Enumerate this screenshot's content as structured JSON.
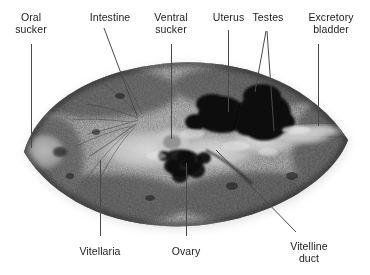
{
  "figure": {
    "image_type": "grayscale photomicrograph",
    "background_color": "#ffffff",
    "line_color": "#4a4a4a",
    "text_color": "#1b1b1b"
  },
  "labels": [
    {
      "id": "oral-sucker",
      "text": "Oral\nsucker",
      "x": 31,
      "y": 12,
      "align": "center",
      "position": "top-left"
    },
    {
      "id": "intestine",
      "text": "Intestine",
      "x": 110,
      "y": 12,
      "align": "center",
      "position": "top"
    },
    {
      "id": "ventral-sucker",
      "text": "Ventral\nsucker",
      "x": 171,
      "y": 12,
      "align": "center",
      "position": "top"
    },
    {
      "id": "uterus",
      "text": "Uterus",
      "x": 228,
      "y": 12,
      "align": "center",
      "position": "top"
    },
    {
      "id": "testes",
      "text": "Testes",
      "x": 268,
      "y": 12,
      "align": "center",
      "position": "top"
    },
    {
      "id": "excretory-bladder",
      "text": "Excretory\nbladder",
      "x": 331,
      "y": 12,
      "align": "center",
      "position": "top-right"
    },
    {
      "id": "vitellaria",
      "text": "Vitellaria",
      "x": 100,
      "y": 246,
      "align": "center",
      "position": "bottom-left"
    },
    {
      "id": "ovary",
      "text": "Ovary",
      "x": 186,
      "y": 246,
      "align": "center",
      "position": "bottom"
    },
    {
      "id": "vitelline-duct",
      "text": "Vitelline\nduct",
      "x": 309,
      "y": 241,
      "align": "center",
      "position": "bottom-right"
    }
  ],
  "leaders": [
    {
      "id": "leader-oral-sucker",
      "type": "vertical",
      "x": 31,
      "y1": 44,
      "y2": 148
    },
    {
      "id": "leader-intestine",
      "type": "diagonal",
      "x1": 104,
      "y1": 28,
      "x2": 137,
      "y2": 116
    },
    {
      "id": "leader-ventral-sucker",
      "type": "vertical",
      "x": 171,
      "y1": 44,
      "y2": 139
    },
    {
      "id": "leader-uterus",
      "type": "vertical",
      "x": 228,
      "y1": 30,
      "y2": 112
    },
    {
      "id": "leader-testes-left",
      "type": "diagonal",
      "x1": 266,
      "y1": 31,
      "x2": 255,
      "y2": 92
    },
    {
      "id": "leader-testes-right",
      "type": "diagonal",
      "x1": 267,
      "y1": 31,
      "x2": 274,
      "y2": 131
    },
    {
      "id": "leader-excretory-bladder",
      "type": "vertical",
      "x": 318,
      "y1": 44,
      "y2": 126
    },
    {
      "id": "leader-vitellaria",
      "type": "vertical",
      "x": 100,
      "y1": 160,
      "y2": 236
    },
    {
      "id": "leader-ovary",
      "type": "vertical",
      "x": 186,
      "y1": 163,
      "y2": 236
    },
    {
      "id": "leader-vitelline-duct",
      "type": "diagonal",
      "x1": 216,
      "y1": 150,
      "x2": 296,
      "y2": 232
    }
  ],
  "anatomy_notes": {
    "body_outline": "pointed-oval (lens) body spanning roughly x 22-350, y 62-226",
    "oral_sucker": "pale grey knob at the anterior (left) tip",
    "ventral_sucker": "pale zone at mid-body, slightly left of centre",
    "uterus": "large near-black mass right of centre",
    "testes": "two dark tandem masses in the posterior half",
    "ovary": "dark lobed structure below the ventral sucker",
    "vitellaria": "dense dark speckled follicles filling the lateral fields",
    "excretory_bladder": "pale streak near the posterior (right) tip"
  }
}
